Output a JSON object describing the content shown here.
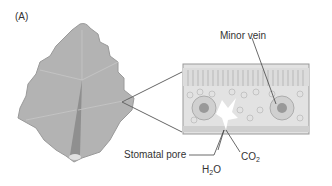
{
  "figure": {
    "panel_label": "(A)",
    "labels": {
      "minor_vein": "Minor vein",
      "stomatal_pore": "Stomatal pore",
      "co2_main": "CO",
      "co2_sub": "2",
      "h2o_h": "H",
      "h2o_sub": "2",
      "h2o_o": "O"
    },
    "colors": {
      "leaf_fill": "#b3b3b3",
      "leaf_shadow": "#8f8f8f",
      "cross_section_bg": "#d9d9d9",
      "line": "#555555"
    }
  }
}
